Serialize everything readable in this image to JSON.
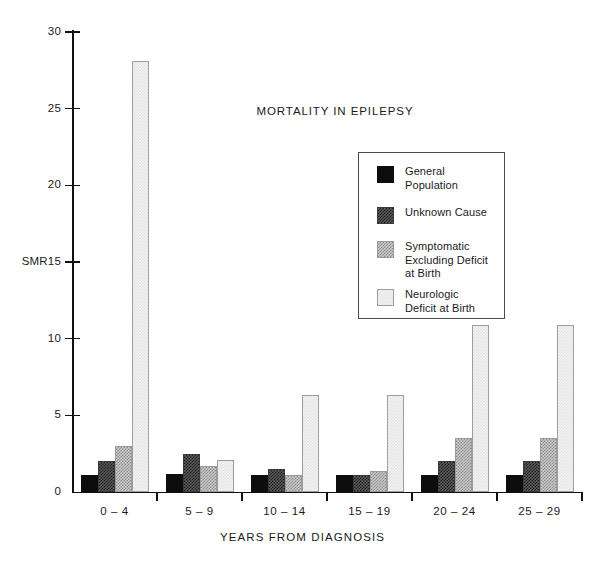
{
  "chart_data": {
    "type": "bar",
    "title": "MORTALITY IN EPILEPSY",
    "xlabel": "YEARS FROM DIAGNOSIS",
    "ylabel": "SMR",
    "ylim": [
      0,
      30
    ],
    "yticks": [
      0,
      5,
      10,
      15,
      20,
      25,
      30
    ],
    "ytick_labels": [
      "0",
      "5",
      "10",
      "15",
      "20",
      "25",
      "30"
    ],
    "grid": false,
    "legend_position": "upper-center-right",
    "categories": [
      "0 – 4",
      "5 – 9",
      "10 – 14",
      "15 – 19",
      "20 – 24",
      "25 – 29"
    ],
    "series": [
      {
        "name": "General\nPopulation",
        "legend_label": "General\nPopulation",
        "color": "#0d0d0d",
        "values": [
          1.1,
          1.2,
          1.1,
          1.1,
          1.1,
          1.1
        ]
      },
      {
        "name": "Unknown Cause",
        "legend_label": "Unknown Cause",
        "color": "#4a4a4a",
        "values": [
          2.0,
          2.5,
          1.5,
          1.1,
          2.0,
          2.0
        ]
      },
      {
        "name": "Symptomatic Excluding Deficit at Birth",
        "legend_label": "Symptomatic\nExcluding Deficit\nat Birth",
        "color": "#b8b8b8",
        "values": [
          3.0,
          1.7,
          1.1,
          1.4,
          3.5,
          3.5
        ]
      },
      {
        "name": "Neurologic Deficit at Birth",
        "legend_label": "Neurologic\nDeficit at Birth",
        "color": "#efefef",
        "values": [
          28.1,
          2.1,
          6.3,
          6.3,
          10.9,
          10.9
        ]
      }
    ]
  },
  "axis": {
    "y_title": "SMR",
    "y_title_attached_tick": "15"
  }
}
